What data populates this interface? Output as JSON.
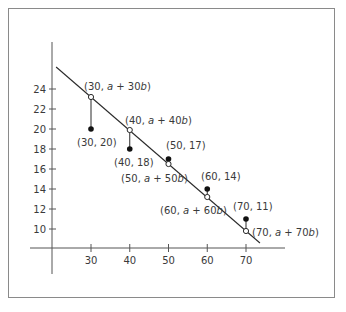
{
  "chart_data": {
    "type": "scatter",
    "title": "",
    "xlabel": "",
    "ylabel": "",
    "x_ticks": [
      30,
      40,
      50,
      60,
      70
    ],
    "y_ticks": [
      10,
      12,
      14,
      16,
      18,
      20,
      22,
      24
    ],
    "xlim": [
      20,
      76
    ],
    "ylim": [
      8,
      28
    ],
    "grid": false,
    "legend": null,
    "series": [
      {
        "name": "observed",
        "marker": "filled-circle",
        "points": [
          {
            "x": 30,
            "y": 20,
            "label": "(30, 20)"
          },
          {
            "x": 40,
            "y": 18,
            "label": "(40, 18)"
          },
          {
            "x": 50,
            "y": 17,
            "label": "(50, 17)"
          },
          {
            "x": 60,
            "y": 14,
            "label": "(60, 14)"
          },
          {
            "x": 70,
            "y": 11,
            "label": "(70, 11)"
          }
        ]
      },
      {
        "name": "fitted",
        "marker": "open-circle",
        "points": [
          {
            "x": 30,
            "y": 23.2,
            "label_pre": "(30, ",
            "label_var": "a",
            "label_mid": " + 30",
            "label_var2": "b",
            "label_post": ")"
          },
          {
            "x": 40,
            "y": 19.9,
            "label_pre": "(40, ",
            "label_var": "a",
            "label_mid": " + 40",
            "label_var2": "b",
            "label_post": ")"
          },
          {
            "x": 50,
            "y": 16.5,
            "label_pre": "(50, ",
            "label_var": "a",
            "label_mid": " + 50",
            "label_var2": "b",
            "label_post": ")"
          },
          {
            "x": 60,
            "y": 13.2,
            "label_pre": "(60, ",
            "label_var": "a",
            "label_mid": " + 60",
            "label_var2": "b",
            "label_post": ")"
          },
          {
            "x": 70,
            "y": 9.8,
            "label_pre": "(70, ",
            "label_var": "a",
            "label_mid": " + 70",
            "label_var2": "b",
            "label_post": ")"
          }
        ]
      }
    ],
    "regression_line": {
      "x1": 21,
      "y1": 26.2,
      "x2": 73.6,
      "y2": 8.6
    },
    "annotation": "vertical residual segments connect each observed point to its fitted point on the line"
  },
  "colors": {
    "ink": "#2a2a2a",
    "axis": "#555555",
    "frame": "#8a8a8a"
  }
}
